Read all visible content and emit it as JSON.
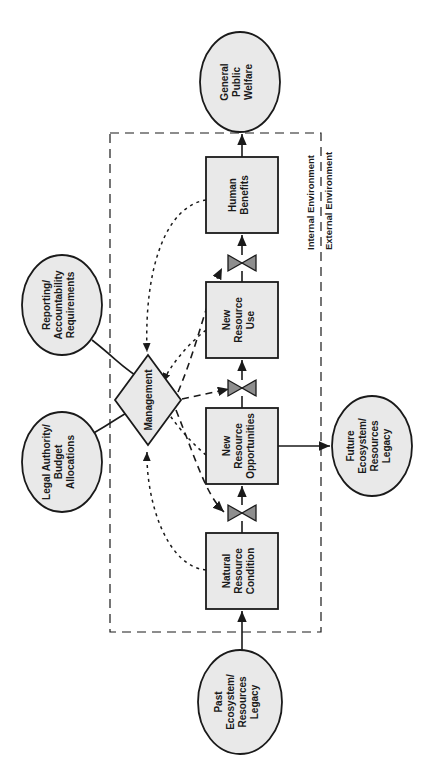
{
  "diagram": {
    "colors": {
      "shape_fill": "#e9e9e9",
      "stroke": "#1a1a1a",
      "background": "#ffffff"
    },
    "boundary": {
      "internal_label": "Internal Environment",
      "external_label": "External Environment",
      "style": "dashed"
    },
    "ellipses": [
      {
        "id": "general-public-welfare",
        "lines": [
          "General",
          "Public",
          "Welfare"
        ],
        "cx": 240,
        "cy": 82,
        "rx": 40,
        "ry": 50
      },
      {
        "id": "reporting-accountability-requirements",
        "lines": [
          "Reporting/",
          "Accountability",
          "Requirements"
        ],
        "cx": 62,
        "cy": 305,
        "rx": 40,
        "ry": 50
      },
      {
        "id": "legal-authority-budget-allocations",
        "lines": [
          "Legal Authority/",
          "Budget",
          "Allocations"
        ],
        "cx": 62,
        "cy": 462,
        "rx": 40,
        "ry": 50
      },
      {
        "id": "future-ecosystem-resources-legacy",
        "lines": [
          "Future",
          "Ecosystem/",
          "Resources",
          "Legacy"
        ],
        "cx": 372,
        "cy": 446,
        "rx": 40,
        "ry": 50
      },
      {
        "id": "past-ecosystem-resources-legacy",
        "lines": [
          "Past",
          "Ecosystem/",
          "Resources",
          "Legacy"
        ],
        "cx": 240,
        "cy": 702,
        "rx": 42,
        "ry": 52
      }
    ],
    "boxes": [
      {
        "id": "human-benefits",
        "lines": [
          "Human",
          "Benefits"
        ],
        "x": 206,
        "y": 157,
        "w": 72,
        "h": 76
      },
      {
        "id": "new-resource-use",
        "lines": [
          "New",
          "Resource",
          "Use"
        ],
        "x": 206,
        "y": 282,
        "w": 72,
        "h": 76
      },
      {
        "id": "new-resource-opportunities",
        "lines": [
          "New",
          "Resource",
          "Opportunities"
        ],
        "x": 206,
        "y": 408,
        "w": 72,
        "h": 76
      },
      {
        "id": "natural-resource-condition",
        "lines": [
          "Natural",
          "Resource",
          "Condition"
        ],
        "x": 206,
        "y": 533,
        "w": 72,
        "h": 76
      }
    ],
    "diamond": {
      "id": "management",
      "label": "Management",
      "cx": 148,
      "cy": 400,
      "rx": 33,
      "ry": 45
    },
    "valves": [
      {
        "id": "valve-human-benefits-inflow",
        "cx": 242,
        "cy": 263
      },
      {
        "id": "valve-new-resource-use-inflow",
        "cx": 242,
        "cy": 388
      },
      {
        "id": "valve-new-resource-opportunities-inflow",
        "cx": 242,
        "cy": 513
      }
    ]
  }
}
